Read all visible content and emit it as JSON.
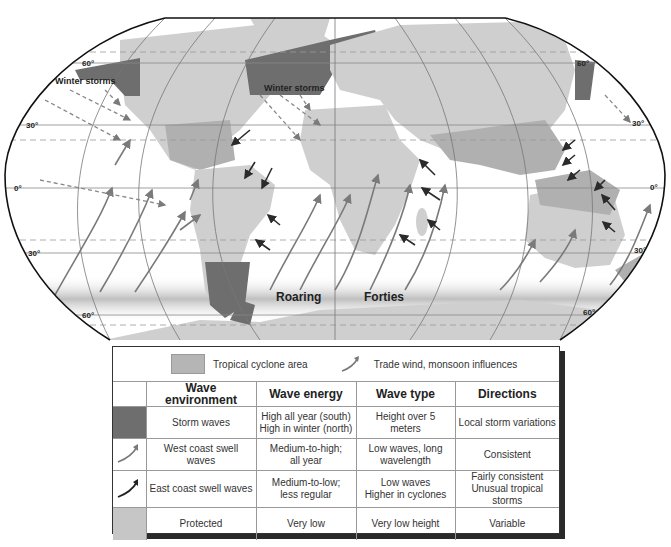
{
  "map": {
    "title": "World wave environments map",
    "latitude_labels": {
      "lat60_left": "60°",
      "lat60_right": "60°",
      "lat30_left": "30°",
      "lat30_right": "30°",
      "lat0_left": "0°",
      "lat0_right": "0°",
      "lat30s_left": "30°",
      "lat30s_right": "30°",
      "lat60s_left": "60°",
      "lat60s_right": "60°"
    },
    "annotations": {
      "winter_storms_pacific": "Winter storms",
      "winter_storms_atlantic": "Winter storms",
      "roaring": "Roaring",
      "forties": "Forties"
    },
    "colors": {
      "land": "#cfcfcf",
      "storm_waves": "#6e6e6e",
      "tropical_cyclone": "#b0b0b0",
      "protected": "#c6c6c6",
      "ocean": "#ffffff",
      "west_swell_arrow": "#7a7a7a",
      "east_swell_arrow": "#2b2b2b",
      "roaring_forties_band": "#bdbdbd"
    }
  },
  "legend": {
    "key": {
      "tropical_cyclone_label": "Tropical cyclone area",
      "trade_wind_label": "Trade wind, monsoon influences"
    },
    "table": {
      "headers": [
        "",
        "Wave environment",
        "Wave energy",
        "Wave type",
        "Directions"
      ],
      "rows": [
        {
          "symbol": "storm-swatch",
          "environment": "Storm waves",
          "energy": "High all year (south)\nHigh in winter (north)",
          "energy_line1": "High all year (south)",
          "energy_line2": "High in winter (north)",
          "type": "Height over 5 meters",
          "directions": "Local storm variations"
        },
        {
          "symbol": "west-swell-arrow",
          "environment": "West coast swell waves",
          "energy_line1": "Medium-to-high;",
          "energy_line2": "all year",
          "type_line1": "Low waves, long",
          "type_line2": "wavelength",
          "directions": "Consistent"
        },
        {
          "symbol": "east-swell-arrow",
          "environment": "East coast swell waves",
          "energy_line1": "Medium-to-low;",
          "energy_line2": "less regular",
          "type_line1": "Low waves",
          "type_line2": "Higher in cyclones",
          "directions_line1": "Fairly consistent",
          "directions_line2": "Unusual tropical storms"
        },
        {
          "symbol": "protected-swatch",
          "environment": "Protected",
          "energy": "Very low",
          "type": "Very low height",
          "directions": "Variable"
        }
      ]
    }
  }
}
